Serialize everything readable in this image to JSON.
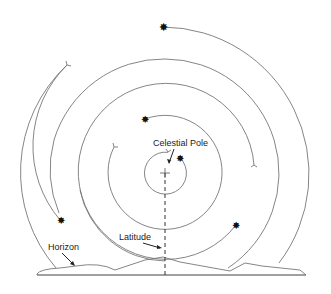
{
  "diagram": {
    "labels": {
      "celestial_pole": "Celestial Pole",
      "latitude": "Latitude",
      "horizon": "Horizon"
    },
    "trails": [
      {
        "name": "trail-1",
        "description": "innermost full circle around pole",
        "has_star": true
      },
      {
        "name": "trail-2",
        "description": "circle with star at upper-left",
        "has_star": true
      },
      {
        "name": "trail-3",
        "description": "arc ending at lower-right star",
        "has_star": true
      },
      {
        "name": "trail-4",
        "description": "arc ending at lower-left star",
        "has_star": true
      },
      {
        "name": "trail-5",
        "description": "outermost arc with star at top",
        "has_star": true
      }
    ],
    "markers": {
      "star_icon": "star",
      "trail_start_icon": "tail-fork",
      "pole_icon": "crosshair"
    },
    "colors": {
      "line": "#777777",
      "text": "#222222",
      "star": "#111111"
    }
  }
}
